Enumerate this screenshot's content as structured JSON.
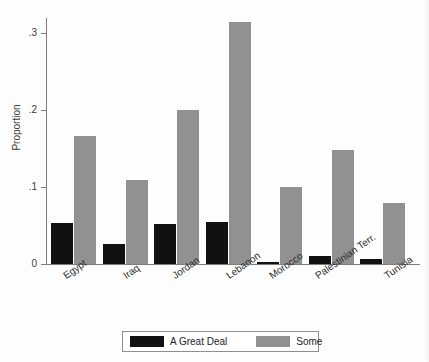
{
  "chart_data": {
    "type": "bar",
    "title": "",
    "xlabel": "",
    "ylabel": "Proportion",
    "ylim": [
      0,
      0.33
    ],
    "yticks": [
      0,
      0.1,
      0.2,
      0.3
    ],
    "ytick_labels": [
      "0",
      ".1",
      ".2",
      ".3"
    ],
    "grid": false,
    "legend_position": "bottom",
    "categories": [
      "Egypt",
      "Iraq",
      "Jordan",
      "Lebanon",
      "Morocco",
      "Palestinian Terr.",
      "Tunisia"
    ],
    "series": [
      {
        "name": "A Great Deal",
        "color": "#111111",
        "values": [
          0.053,
          0.026,
          0.052,
          0.054,
          0.003,
          0.01,
          0.006
        ]
      },
      {
        "name": "Some",
        "color": "#919191",
        "values": [
          0.166,
          0.109,
          0.2,
          0.314,
          0.1,
          0.148,
          0.079
        ]
      }
    ]
  },
  "axis": {
    "y_title": "Proportion"
  },
  "legend": {
    "items": [
      {
        "label": "A Great Deal",
        "swatch": "black-swatch"
      },
      {
        "label": "Some",
        "swatch": "gray-swatch"
      }
    ]
  },
  "bottom_text": "",
  "colors": {
    "great_deal": "#111111",
    "some": "#919191",
    "axis": "#7d7d7d",
    "background": "#fdfdfd"
  }
}
